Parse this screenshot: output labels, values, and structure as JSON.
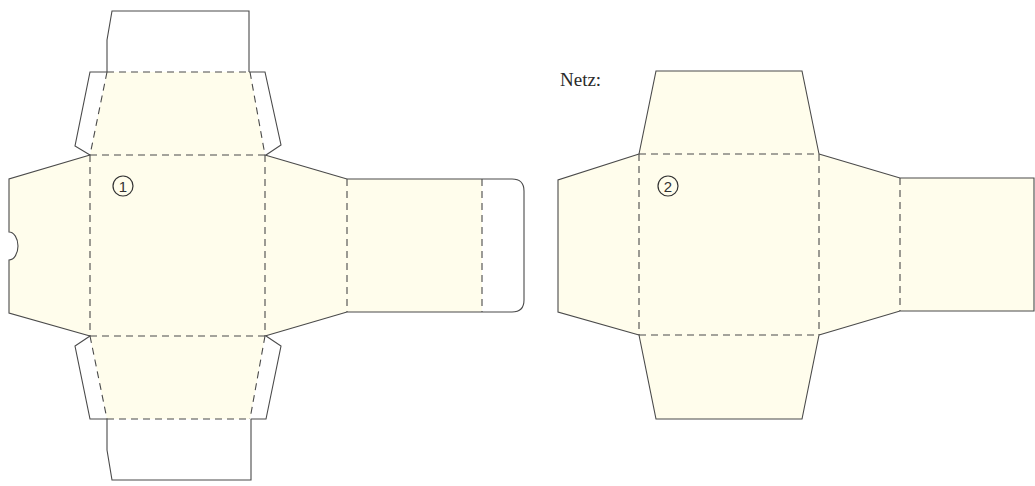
{
  "title": "Netz:",
  "nets": [
    {
      "id": "net-1",
      "marker": "1",
      "description": "Box net with glue tabs (top tab, bottom tab, side flaps, right tab with rounded corners, left notch)"
    },
    {
      "id": "net-2",
      "marker": "2",
      "description": "Box net without glue tabs"
    }
  ],
  "colors": {
    "paper_fill": "#fffdec",
    "line": "#4a4a4a"
  }
}
